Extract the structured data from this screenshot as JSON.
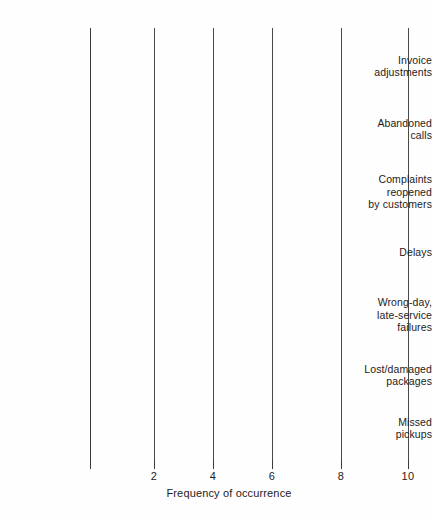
{
  "chart_data": {
    "type": "bar",
    "orientation": "horizontal",
    "title": "",
    "xlabel": "Frequency of occurrence",
    "ylabel": "",
    "xlim": [
      0,
      10
    ],
    "xticks": [
      0,
      2,
      4,
      6,
      8,
      10
    ],
    "xtick_labels": [
      "",
      "2",
      "4",
      "6",
      "8",
      "10"
    ],
    "grid": true,
    "legend": null,
    "categories": [
      "Invoice adjustments",
      "Abandoned calls",
      "Complaints reopened by customers",
      "Delays",
      "Wrong-day, late-service failures",
      "Lost/damaged packages",
      "Missed pickups"
    ],
    "category_label_lines": [
      [
        "Invoice",
        "adjustments"
      ],
      [
        "Abandoned",
        "calls"
      ],
      [
        "Complaints",
        "reopened",
        "by customers"
      ],
      [
        "Delays"
      ],
      [
        "Wrong-day,",
        "late-service",
        "failures"
      ],
      [
        "Lost/damaged",
        "packages"
      ],
      [
        "Missed",
        "pickups"
      ]
    ],
    "values": [
      1,
      1,
      5.7,
      5.7,
      5.7,
      10,
      10
    ],
    "colors": {
      "bar_gradient_start": "#6f6f6f",
      "bar_gradient_end": "#a9a9a9",
      "axis": "#3b3b3b",
      "gridline": "#4a4a4a",
      "text": "#1e1b1b",
      "background": "#fefefe"
    }
  }
}
